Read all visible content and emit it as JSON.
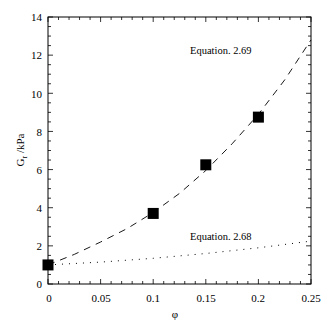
{
  "chart_data": {
    "type": "line",
    "title": "",
    "xlabel": "φ",
    "ylabel": "G_r /kPa",
    "xlim": [
      0,
      0.25
    ],
    "ylim": [
      0,
      14
    ],
    "x_ticks": [
      "0",
      "0.05",
      "0.1",
      "0.15",
      "0.2",
      "0.25"
    ],
    "y_ticks": [
      "0",
      "2",
      "4",
      "6",
      "8",
      "10",
      "12",
      "14"
    ],
    "grid": false,
    "legend": null,
    "series": [
      {
        "name": "Experimental data",
        "style": "filled-square-markers",
        "x": [
          0,
          0.1,
          0.15,
          0.2
        ],
        "y": [
          1.0,
          3.7,
          6.25,
          8.75
        ]
      },
      {
        "name": "Equation. 2.69",
        "style": "dashed",
        "x": [
          0,
          0.025,
          0.05,
          0.075,
          0.1,
          0.125,
          0.15,
          0.175,
          0.2,
          0.225,
          0.25
        ],
        "y": [
          1.0,
          1.55,
          2.2,
          2.9,
          3.75,
          4.75,
          5.95,
          7.35,
          8.9,
          10.7,
          12.8
        ]
      },
      {
        "name": "Equation. 2.68",
        "style": "dotted",
        "x": [
          0,
          0.05,
          0.1,
          0.15,
          0.2,
          0.25
        ],
        "y": [
          1.0,
          1.15,
          1.35,
          1.6,
          1.9,
          2.25
        ]
      }
    ],
    "annotations": [
      {
        "text": "Equation. 2.69",
        "x": 0.135,
        "y": 12.1
      },
      {
        "text": "Equation. 2.68",
        "x": 0.135,
        "y": 2.4
      }
    ]
  },
  "labels": {
    "xlabel": "φ",
    "ylabel_main": "G",
    "ylabel_sub": "r",
    "ylabel_unit": " /kPa",
    "eq269": "Equation. 2.69",
    "eq268": "Equation. 2.68",
    "xt0": "0",
    "xt1": "0.05",
    "xt2": "0.1",
    "xt3": "0.15",
    "xt4": "0.2",
    "xt5": "0.25",
    "yt0": "0",
    "yt1": "2",
    "yt2": "4",
    "yt3": "6",
    "yt4": "8",
    "yt5": "10",
    "yt6": "12",
    "yt7": "14"
  }
}
